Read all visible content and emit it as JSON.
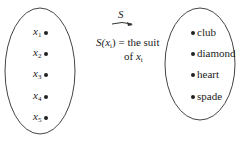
{
  "domain_set": {
    "items": [
      {
        "var": "x",
        "sub": "1"
      },
      {
        "var": "x",
        "sub": "2"
      },
      {
        "var": "x",
        "sub": "3"
      },
      {
        "var": "x",
        "sub": "4"
      },
      {
        "var": "x",
        "sub": "5"
      }
    ]
  },
  "codomain_set": {
    "items": [
      "club",
      "diamond",
      "heart",
      "spade"
    ]
  },
  "mapping": {
    "arrow_label": "S",
    "definition_line1_func": "S(",
    "definition_line1_var": "x",
    "definition_line1_sub": "i",
    "definition_line1_rest": ") = the suit",
    "definition_line2_of": "of ",
    "definition_line2_var": "x",
    "definition_line2_sub": "i"
  }
}
